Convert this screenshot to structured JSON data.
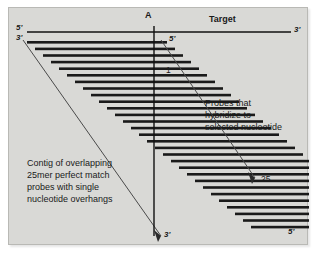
{
  "figure": {
    "kind": "diagram",
    "background_color": "#d9d9d6",
    "ink_color": "#1a1a1a"
  },
  "target": {
    "label": "Target",
    "five_prime": "5'",
    "three_prime": "3'",
    "line_y": 24,
    "x_start": 18,
    "x_end": 282
  },
  "selected_nucleotide": {
    "label": "A",
    "marker_x": 145,
    "vertical_line_top": 18,
    "vertical_line_bottom": 228,
    "bottom_label": "3'"
  },
  "probe_numbers": {
    "first": "1",
    "last": "25"
  },
  "annotations": {
    "right": {
      "lines": [
        "Probes that",
        "hybridize to",
        "selected nucleotide"
      ]
    },
    "left": {
      "lines": [
        "Contig of overlapping",
        "25mer perfect match",
        "probes with single",
        "nucleotide overhangs"
      ]
    }
  },
  "strand_labels": {
    "top_left_five": "5'",
    "top_left_three": "3'",
    "first_probe_five": "5'",
    "last_probe_five": "5'"
  },
  "chart_data": {
    "type": "diagram",
    "title": "Contig of overlapping 25mer perfect match probes",
    "probe_count": 29,
    "probe_step_x": 8,
    "probe_step_y": 6.6,
    "probe_length": 140,
    "probe_thickness": 2.6,
    "first_probe": {
      "x": 18,
      "y": 33
    },
    "probes": [
      {
        "index": 1,
        "x": 18,
        "y": 33,
        "length": 140
      },
      {
        "index": 2,
        "x": 26,
        "y": 39.6,
        "length": 140
      },
      {
        "index": 3,
        "x": 34,
        "y": 46.2,
        "length": 140
      },
      {
        "index": 4,
        "x": 42,
        "y": 52.8,
        "length": 140
      },
      {
        "index": 5,
        "x": 50,
        "y": 59.4,
        "length": 140
      },
      {
        "index": 6,
        "x": 58,
        "y": 66,
        "length": 140
      },
      {
        "index": 7,
        "x": 66,
        "y": 72.6,
        "length": 140
      },
      {
        "index": 8,
        "x": 74,
        "y": 79.2,
        "length": 140
      },
      {
        "index": 9,
        "x": 82,
        "y": 85.8,
        "length": 140
      },
      {
        "index": 10,
        "x": 90,
        "y": 92.4,
        "length": 140
      },
      {
        "index": 11,
        "x": 98,
        "y": 99,
        "length": 140
      },
      {
        "index": 12,
        "x": 106,
        "y": 105.6,
        "length": 140
      },
      {
        "index": 13,
        "x": 114,
        "y": 112.2,
        "length": 140
      },
      {
        "index": 14,
        "x": 122,
        "y": 118.8,
        "length": 140
      },
      {
        "index": 15,
        "x": 130,
        "y": 125.4,
        "length": 140
      },
      {
        "index": 16,
        "x": 138,
        "y": 132,
        "length": 140
      },
      {
        "index": 17,
        "x": 146,
        "y": 138.6,
        "length": 140
      },
      {
        "index": 18,
        "x": 154,
        "y": 145.2,
        "length": 140
      },
      {
        "index": 19,
        "x": 162,
        "y": 151.8,
        "length": 140
      },
      {
        "index": 20,
        "x": 170,
        "y": 158.4,
        "length": 140
      },
      {
        "index": 21,
        "x": 178,
        "y": 165,
        "length": 140
      },
      {
        "index": 22,
        "x": 186,
        "y": 171.6,
        "length": 140
      },
      {
        "index": 23,
        "x": 194,
        "y": 178.2,
        "length": 140
      },
      {
        "index": 24,
        "x": 202,
        "y": 184.8,
        "length": 140
      },
      {
        "index": 25,
        "x": 210,
        "y": 191.4,
        "length": 140
      },
      {
        "index": 26,
        "x": 218,
        "y": 198,
        "length": 140
      },
      {
        "index": 27,
        "x": 226,
        "y": 204.6,
        "length": 140
      },
      {
        "index": 28,
        "x": 234,
        "y": 211.2,
        "length": 140
      },
      {
        "index": 29,
        "x": 242,
        "y": 217.8,
        "length": 140
      }
    ],
    "guide_lines": [
      {
        "name": "left-edge-guide",
        "x1": 14,
        "y1": 32,
        "x2": 152,
        "y2": 228
      },
      {
        "name": "right-edge-guide",
        "x1": 152,
        "y1": 32,
        "x2": 248,
        "y2": 172
      }
    ],
    "xlabel": "",
    "ylabel": "",
    "grid": false,
    "legend": "none"
  }
}
